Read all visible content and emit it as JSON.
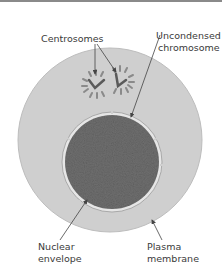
{
  "diagram": {
    "labels": {
      "centrosomes": "Centrosomes",
      "chromosome_line1": "Uncondensed",
      "chromosome_line2": "chromosome",
      "nuclear_line1": "Nuclear",
      "nuclear_line2": "envelope",
      "plasma_line1": "Plasma",
      "plasma_line2": "membrane"
    },
    "colors": {
      "cytoplasm": "#cfcfcf",
      "nucleus": "#707070",
      "envelope": "#e8e8e8",
      "arrow": "#444444",
      "text": "#3a3a3a"
    }
  }
}
